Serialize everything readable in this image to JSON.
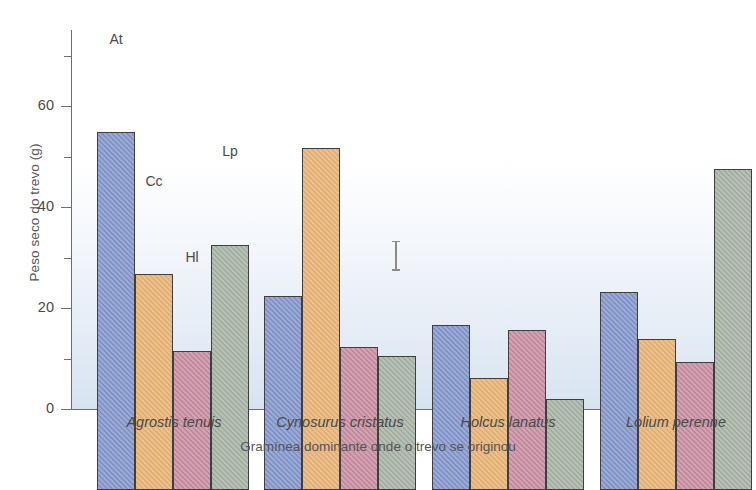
{
  "chart_data": {
    "type": "bar",
    "title": "",
    "xlabel": "Gramínea dominante onde o trevo se originou",
    "ylabel": "Peso seco do trevo (g)",
    "ylim": [
      0,
      75
    ],
    "yticks_major": [
      0,
      20,
      40,
      60
    ],
    "yticks_minor": [
      10,
      30,
      50,
      70
    ],
    "grid": false,
    "legend_position": "inline-annotations",
    "categories": [
      "Agrostis tenuis",
      "Cynosurus cristatus",
      "Holcus lanatus",
      "Lolium perenne"
    ],
    "series": [
      {
        "name": "At",
        "color": "#7d91c6",
        "values": [
          71.0,
          38.6,
          32.7,
          39.2
        ]
      },
      {
        "name": "Cc",
        "color": "#e3ae6d",
        "values": [
          42.8,
          67.8,
          22.2,
          30.0
        ]
      },
      {
        "name": "Hl",
        "color": "#c2879b",
        "values": [
          27.6,
          28.3,
          31.8,
          25.5
        ]
      },
      {
        "name": "Lp",
        "color": "#a0ad9d",
        "values": [
          48.7,
          26.5,
          18.0,
          63.8
        ]
      }
    ],
    "annotations": [
      {
        "label": "At",
        "group": 0,
        "series": 0
      },
      {
        "label": "Cc",
        "group": 0,
        "series": 1
      },
      {
        "label": "Hl",
        "group": 0,
        "series": 2
      },
      {
        "label": "Lp",
        "group": 0,
        "series": 3
      }
    ],
    "error_bar": {
      "label": "",
      "top_value": 33.5,
      "bottom_value": 27.5
    }
  },
  "axis": {
    "y_title": "Peso seco do trevo (g)",
    "x_title": "Gramínea dominante onde o trevo se originou",
    "tick_labels": {
      "t0": "0",
      "t20": "20",
      "t40": "40",
      "t60": "60"
    }
  },
  "bar_labels": {
    "at": "At",
    "cc": "Cc",
    "hl": "Hl",
    "lp": "Lp"
  },
  "categories": {
    "c0": "Agrostis tenuis",
    "c1": "Cynosurus cristatus",
    "c2": "Holcus lanatus",
    "c3": "Lolium perenne"
  },
  "caption": {
    "stub": ""
  }
}
